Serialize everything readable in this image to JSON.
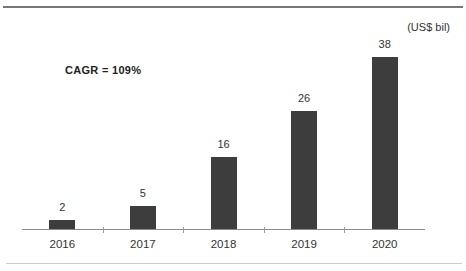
{
  "header": {
    "unit_label": "(US$ bil)",
    "annotation": "CAGR = 109%"
  },
  "chart_data": {
    "type": "bar",
    "categories": [
      "2016",
      "2017",
      "2018",
      "2019",
      "2020"
    ],
    "values": [
      2,
      5,
      16,
      26,
      38
    ],
    "title": "",
    "xlabel": "",
    "ylabel": "(US$ bil)",
    "ylim": [
      0,
      40
    ],
    "annotations": [
      "CAGR = 109%"
    ],
    "grid": false,
    "legend": "none",
    "colors": {
      "bar": "#3d3d3d",
      "axis": "#8a8a8a",
      "text": "#333333",
      "top_rule": "#777777",
      "bottom_rule": "#cccccc"
    }
  }
}
